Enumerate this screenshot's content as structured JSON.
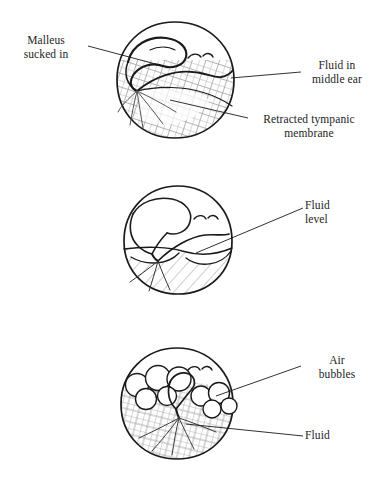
{
  "figure": {
    "type": "medical-illustration",
    "panel_count": 3,
    "ink_color": "#1a1a1a",
    "hatch_color": "#9a9a9a",
    "background": "#ffffff"
  },
  "panels": [
    {
      "id": "panel-top",
      "name": "retracted-drum-with-fluid",
      "center": {
        "x": 175,
        "y": 80
      },
      "radius": 58,
      "features": [
        "malleus",
        "fluid line",
        "cross-hatched retracted membrane"
      ]
    },
    {
      "id": "panel-middle",
      "name": "drum-with-fluid-level",
      "center": {
        "x": 178,
        "y": 240
      },
      "radius": 54,
      "features": [
        "malleus",
        "air-fluid level",
        "diagonal hatched fluid"
      ]
    },
    {
      "id": "panel-bottom",
      "name": "drum-with-air-bubbles",
      "center": {
        "x": 177,
        "y": 404
      },
      "radius": 56,
      "features": [
        "malleus",
        "air bubbles",
        "cross-hatched fluid"
      ]
    }
  ],
  "labels": {
    "malleus": "Malleus\nsucked in",
    "fluid_middle_ear": "Fluid in\nmiddle ear",
    "retracted_membrane": "Retracted tympanic\nmembrane",
    "fluid_level": "Fluid\nlevel",
    "air_bubbles": "Air\nbubbles",
    "fluid": "Fluid"
  }
}
